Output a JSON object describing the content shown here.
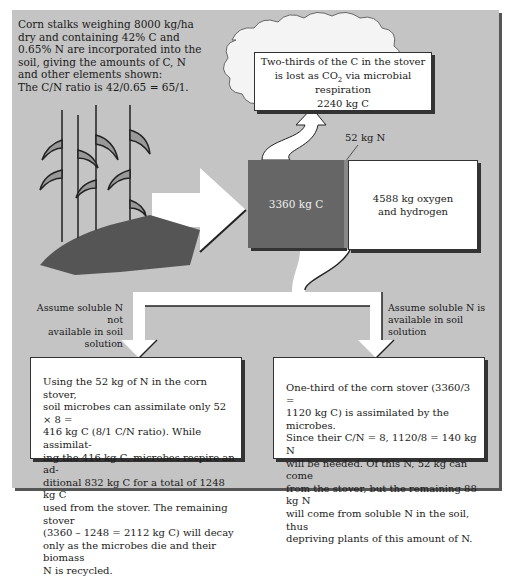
{
  "intro": {
    "lines": [
      "Corn stalks weighing 8000 kg/ha",
      "dry and containing 42% C and",
      "0.65% N are incorporated into the",
      "soil, giving the amounts of C, N",
      "and other elements shown:",
      "The C/N ratio is 42/0.65 = 65/1."
    ]
  },
  "cloud": {
    "line1": "Two-thirds of the C in the stover",
    "line2_pre": "is lost as CO",
    "line2_sub": "2",
    "line2_post": " via microbial respiration",
    "value": "2240 kg C"
  },
  "stover": {
    "carbon": "3360 kg C",
    "nitrogen": "52 kg N",
    "oxygen_hydrogen_line1": "4588 kg oxygen",
    "oxygen_hydrogen_line2": "and hydrogen"
  },
  "branches": {
    "left_label_line1": "Assume soluble N not",
    "left_label_line2": "available in soil solution",
    "right_label_line1": "Assume soluble N is",
    "right_label_line2": "available in soil solution"
  },
  "left_box": {
    "lines": [
      "Using the 52 kg of N in the corn stover,",
      "soil microbes can assimilate only 52 × 8 =",
      "416 kg C (8/1 C/N ratio). While assimilat-",
      "ing the 416 kg C, microbes respire an ad-",
      "ditional 832 kg C for a total of 1248 kg C",
      "used from the stover. The remaining stover",
      "(3360 – 1248 = 2112 kg C) will decay",
      "only as the microbes die and their biomass",
      "N is recycled."
    ]
  },
  "right_box": {
    "lines": [
      "One-third of the corn stover (3360/3 =",
      "1120 kg C) is assimilated by the microbes.",
      "Since their C/N = 8, 1120/8 = 140 kg N",
      "will be needed. Of this N, 52 kg can come",
      "from the stover, but the remaining 88 kg N",
      "will come from soluble N in the soil, thus",
      "depriving plants of this amount of N."
    ]
  },
  "colors": {
    "background": "#c4c4c4",
    "carbon_block": "#666666",
    "arrow": "#ffffff",
    "soil": "#555555"
  }
}
